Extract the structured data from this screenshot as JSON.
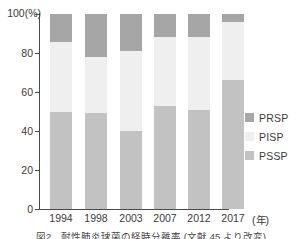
{
  "chart_data": {
    "type": "bar",
    "stacked": true,
    "stack_mode": "percent",
    "title": "",
    "xlabel": "年",
    "ylabel": "",
    "unit_label": "(%)",
    "ylim": [
      0,
      100
    ],
    "yticks": [
      0,
      20,
      40,
      60,
      80,
      100
    ],
    "ytick_labels": [
      "0",
      "20",
      "40",
      "60",
      "80",
      "100"
    ],
    "grid": false,
    "legend_position": "right",
    "categories": [
      "1994",
      "1998",
      "2003",
      "2007",
      "2012",
      "2017"
    ],
    "series": [
      {
        "name": "PSSP",
        "color": "#c2c2c2",
        "values": [
          49.5,
          49.0,
          40.0,
          53.0,
          51.0,
          66.0
        ]
      },
      {
        "name": "PISP",
        "color": "#efefef",
        "values": [
          36.0,
          29.0,
          41.0,
          35.0,
          37.0,
          30.0
        ]
      },
      {
        "name": "PRSP",
        "color": "#a6a6a6",
        "values": [
          14.5,
          22.0,
          19.0,
          12.0,
          12.0,
          4.0
        ]
      }
    ],
    "cumulative_tops": {
      "PSSP": [
        49.5,
        49.0,
        40.0,
        53.0,
        51.0,
        66.0
      ],
      "PISP": [
        85.5,
        78.0,
        81.0,
        88.0,
        88.0,
        96.0
      ],
      "PRSP": [
        100,
        100,
        100,
        100,
        100,
        100
      ]
    },
    "legend": [
      {
        "label": "PRSP",
        "color": "#a6a6a6"
      },
      {
        "label": "PISP",
        "color": "#efefef"
      },
      {
        "label": "PSSP",
        "color": "#c2c2c2"
      }
    ],
    "axis_color": "#4a4a4a",
    "text_color": "#3a3a3a"
  },
  "caption": {
    "text": "図2　耐性肺炎球菌の経時分離率 (文献 45 より改変)"
  }
}
